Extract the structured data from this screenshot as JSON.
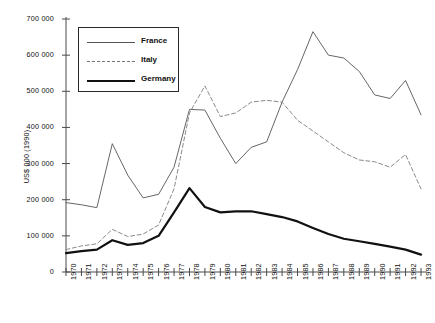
{
  "chart_data": {
    "type": "line",
    "title": "",
    "xlabel": "",
    "ylabel": "US$ 000 (1990)",
    "xlim": [
      1970,
      1993
    ],
    "ylim": [
      0,
      700000
    ],
    "ytick_values": [
      0,
      100000,
      200000,
      300000,
      400000,
      500000,
      600000,
      700000
    ],
    "ytick_labels": [
      "0",
      "100 000",
      "200 000",
      "300 000",
      "400 000",
      "500 000",
      "600 000",
      "700 000"
    ],
    "x": [
      1970,
      1971,
      1972,
      1973,
      1974,
      1975,
      1976,
      1977,
      1978,
      1979,
      1980,
      1981,
      1982,
      1983,
      1984,
      1985,
      1986,
      1987,
      1988,
      1989,
      1990,
      1991,
      1992,
      1993
    ],
    "xtick_labels": [
      "1970",
      "1971",
      "1972",
      "1973",
      "1974",
      "1975",
      "1976",
      "1977",
      "1978",
      "1979",
      "1980",
      "1981",
      "1982",
      "1983",
      "1984",
      "1985",
      "1986",
      "1987",
      "1988",
      "1989",
      "1990",
      "1991",
      "1992",
      "1993"
    ],
    "grid": false,
    "legend_position": "upper-left",
    "series": [
      {
        "name": "France",
        "style": "thin-solid",
        "color": "#555555",
        "values": [
          192000,
          186000,
          178000,
          355000,
          268000,
          205000,
          215000,
          290000,
          450000,
          448000,
          370000,
          300000,
          345000,
          360000,
          470000,
          560000,
          665000,
          600000,
          592000,
          555000,
          490000,
          480000,
          530000,
          435000
        ]
      },
      {
        "name": "Italy",
        "style": "dashed",
        "color": "#8a8a8a",
        "values": [
          62000,
          72000,
          78000,
          118000,
          98000,
          105000,
          130000,
          230000,
          440000,
          515000,
          430000,
          440000,
          470000,
          475000,
          470000,
          420000,
          390000,
          360000,
          330000,
          310000,
          305000,
          290000,
          325000,
          230000
        ]
      },
      {
        "name": "Germany",
        "style": "thick-solid",
        "color": "#111111",
        "values": [
          52000,
          58000,
          62000,
          88000,
          75000,
          80000,
          100000,
          165000,
          232000,
          180000,
          165000,
          168000,
          168000,
          160000,
          152000,
          140000,
          122000,
          105000,
          92000,
          85000,
          78000,
          70000,
          62000,
          48000
        ]
      }
    ]
  },
  "legend": {
    "entries": [
      {
        "label": "France"
      },
      {
        "label": "Italy"
      },
      {
        "label": "Germany"
      }
    ]
  }
}
